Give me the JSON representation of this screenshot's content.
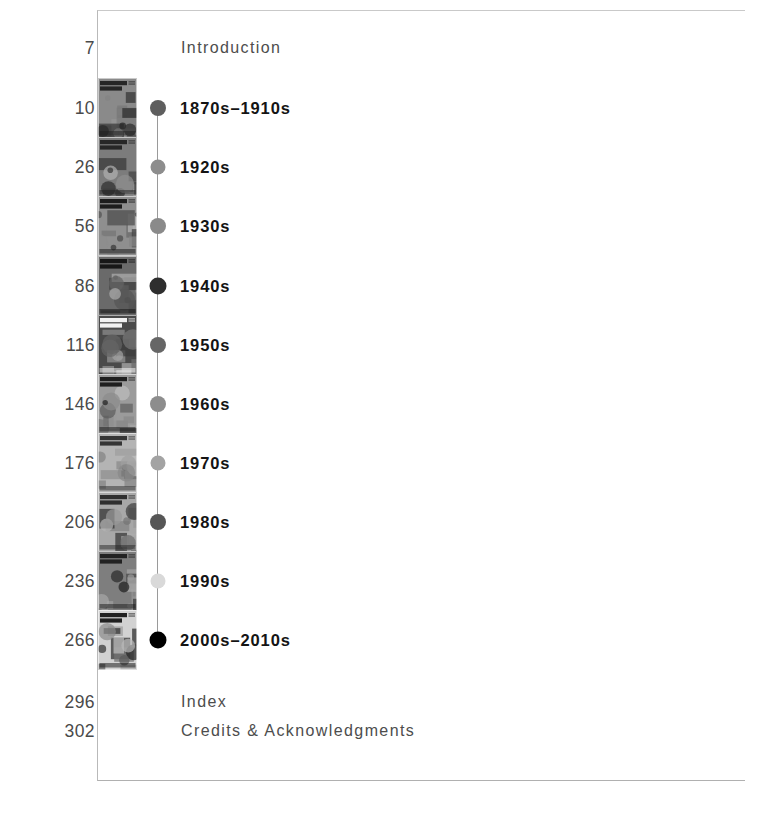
{
  "document": {
    "type": "book-table-of-contents",
    "title": "Contents",
    "frame_color": "#c0c0c0",
    "timeline_line_color": "#9a9a9a",
    "page_number_color": "#4a4a4a",
    "decade_label_color": "#141414",
    "plain_label_color": "#4d4d4d"
  },
  "entries": [
    {
      "page": "7",
      "label": "Introduction",
      "style": "plain",
      "y": 48,
      "has_thumbnail": false,
      "has_dot": false
    },
    {
      "page": "10",
      "label": "1870s–1910s",
      "style": "decade",
      "y": 108,
      "has_thumbnail": true,
      "has_dot": true,
      "dot_color": "#5e5e5e",
      "dot_size": 16,
      "cover": {
        "masthead": "Popular Science",
        "bg": "#8a8a8a",
        "ink": "#1d1d1d"
      }
    },
    {
      "page": "26",
      "label": "1920s",
      "style": "decade",
      "y": 167,
      "has_thumbnail": true,
      "has_dot": true,
      "dot_color": "#8d8d8d",
      "dot_size": 15,
      "cover": {
        "masthead": "Popular Science",
        "bg": "#7c7c7c",
        "ink": "#202020"
      }
    },
    {
      "page": "56",
      "label": "1930s",
      "style": "decade",
      "y": 226,
      "has_thumbnail": true,
      "has_dot": true,
      "dot_color": "#8a8a8a",
      "dot_size": 16,
      "cover": {
        "masthead": "POPULAR SCIENCE",
        "bg": "#8f8f8f",
        "ink": "#141414"
      }
    },
    {
      "page": "86",
      "label": "1940s",
      "style": "decade",
      "y": 286,
      "has_thumbnail": true,
      "has_dot": true,
      "dot_color": "#2e2e2e",
      "dot_size": 17,
      "cover": {
        "masthead": "POPULAR SCIENCE",
        "bg": "#6a6a6a",
        "ink": "#101010"
      }
    },
    {
      "page": "116",
      "label": "1950s",
      "style": "decade",
      "y": 345,
      "has_thumbnail": true,
      "has_dot": true,
      "dot_color": "#666666",
      "dot_size": 16,
      "cover": {
        "masthead": "POPULAR SCIENCE",
        "bg": "#4a4a4a",
        "ink": "#ffffff"
      }
    },
    {
      "page": "146",
      "label": "1960s",
      "style": "decade",
      "y": 404,
      "has_thumbnail": true,
      "has_dot": true,
      "dot_color": "#8d8d8d",
      "dot_size": 16,
      "cover": {
        "masthead": "POPULAR SCIENCE",
        "bg": "#9b9b9b",
        "ink": "#151515"
      }
    },
    {
      "page": "176",
      "label": "1970s",
      "style": "decade",
      "y": 463,
      "has_thumbnail": true,
      "has_dot": true,
      "dot_color": "#a3a3a3",
      "dot_size": 15,
      "cover": {
        "masthead": "Popular Science",
        "bg": "#b4b4b4",
        "ink": "#2a2a2a"
      }
    },
    {
      "page": "206",
      "label": "1980s",
      "style": "decade",
      "y": 522,
      "has_thumbnail": true,
      "has_dot": true,
      "dot_color": "#565656",
      "dot_size": 16,
      "cover": {
        "masthead": "Popular Science",
        "bg": "#a8a8a8",
        "ink": "#252525"
      }
    },
    {
      "page": "236",
      "label": "1990s",
      "style": "decade",
      "y": 581,
      "has_thumbnail": true,
      "has_dot": true,
      "dot_color": "#d9d9d9",
      "dot_size": 15,
      "cover": {
        "masthead": "Popular Science",
        "bg": "#7e7e7e",
        "ink": "#1a1a1a"
      }
    },
    {
      "page": "266",
      "label": "2000s–2010s",
      "style": "decade",
      "y": 640,
      "has_thumbnail": true,
      "has_dot": true,
      "dot_color": "#000000",
      "dot_size": 17,
      "cover": {
        "masthead": "POPULAR SCIENCE",
        "bg": "#d2d2d2",
        "ink": "#101010"
      }
    },
    {
      "page": "296",
      "label": "Index",
      "style": "plain",
      "y": 702,
      "has_thumbnail": false,
      "has_dot": false
    },
    {
      "page": "302",
      "label": "Credits & Acknowledgments",
      "style": "plain",
      "y": 731,
      "has_thumbnail": false,
      "has_dot": false
    }
  ]
}
